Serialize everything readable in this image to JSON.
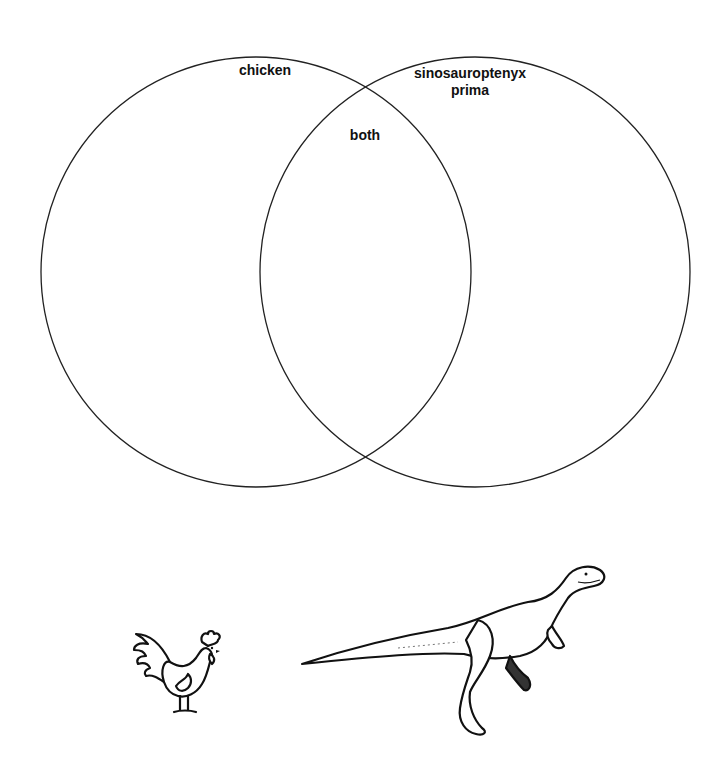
{
  "diagram": {
    "type": "venn",
    "sets": [
      {
        "id": "left",
        "label": "chicken"
      },
      {
        "id": "right",
        "label_line1": "sinosauroptenyx",
        "label_line2": "prima"
      }
    ],
    "intersection_label": "both",
    "circles": [
      {
        "cx": 256,
        "cy": 272,
        "r": 215
      },
      {
        "cx": 475,
        "cy": 272,
        "r": 215
      }
    ],
    "stroke_color": "#222222"
  },
  "images": {
    "chicken": "rooster illustration",
    "dinosaur": "theropod dinosaur illustration"
  }
}
